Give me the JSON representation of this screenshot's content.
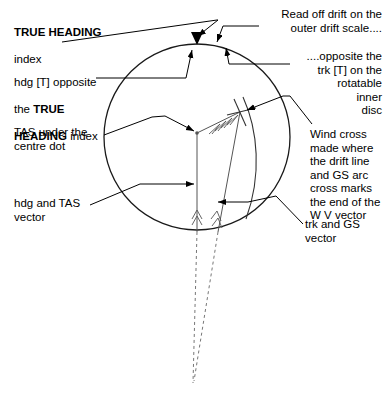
{
  "figure": {
    "circle": {
      "label": "rotatable-inner-disc",
      "cx": 197,
      "cy": 137,
      "r": 93,
      "stroke": "#1a1a1a"
    },
    "centre_dot": {
      "label": "centre-dot",
      "x": 197,
      "y": 133
    },
    "true_heading_index": {
      "label": "true-heading-index",
      "x": 197,
      "y": 44
    },
    "wind_cross": {
      "label": "wind-cross",
      "x": 240,
      "y": 112
    },
    "vectors": [
      {
        "name": "hdg-and-tas-vector",
        "from": [
          197,
          133
        ],
        "to": [
          197,
          232
        ]
      },
      {
        "name": "trk-and-gs-vector",
        "from": [
          240,
          112
        ],
        "to": [
          218,
          232
        ]
      },
      {
        "name": "wv-vector",
        "from": [
          197,
          133
        ],
        "to": [
          240,
          112
        ]
      }
    ],
    "colors": {
      "ink": "#000000",
      "circle_stroke": "#1a1a1a",
      "vector_stroke": "#555555",
      "dashed_stroke": "#777777",
      "background": "#ffffff"
    }
  },
  "annotations": {
    "true_heading": {
      "name": "annotation-true-heading-index",
      "bold_text": "TRUE HEADING",
      "rest_text": "index"
    },
    "hdg_opposite": {
      "name": "annotation-hdg-opposite-true-heading",
      "line1": "hdg [T] opposite",
      "line2_pre": "the ",
      "line2_bold": "TRUE",
      "line3_bold": "HEADING",
      "line3_post": " index"
    },
    "tas_under_dot": {
      "name": "annotation-tas-under-centre-dot",
      "text": "TAS under the\ncentre dot"
    },
    "hdg_tas_vector": {
      "name": "annotation-hdg-and-tas-vector",
      "text": "hdg and TAS\nvector"
    },
    "read_drift": {
      "name": "annotation-read-off-drift",
      "text": "Read off drift on the\nouter drift scale...."
    },
    "opposite_trk": {
      "name": "annotation-opposite-trk",
      "text": "....opposite the\ntrk [T] on the\nrotatable\ninner\ndisc"
    },
    "wind_cross": {
      "name": "annotation-wind-cross",
      "text": "Wind cross\nmade where\nthe drift line\nand GS arc\ncross marks\nthe end of the\nW V vector"
    },
    "trk_gs_vector": {
      "name": "annotation-trk-and-gs-vector",
      "text": "trk and GS\nvector"
    }
  }
}
